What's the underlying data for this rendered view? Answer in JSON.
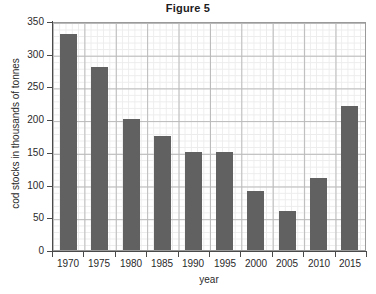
{
  "chart_data": {
    "type": "bar",
    "title": "Figure 5",
    "xlabel": "year",
    "ylabel": "cod stocks in thousands of tonnes",
    "categories": [
      "1970",
      "1975",
      "1980",
      "1985",
      "1990",
      "1995",
      "2000",
      "2005",
      "2010",
      "2015"
    ],
    "values": [
      330,
      280,
      200,
      175,
      150,
      150,
      90,
      60,
      110,
      220
    ],
    "ylim": [
      0,
      350
    ],
    "ytick_values": [
      0,
      50,
      100,
      150,
      200,
      250,
      300,
      350
    ],
    "ytick_labels": [
      "0",
      "50",
      "100",
      "150",
      "200",
      "250",
      "300",
      "350"
    ],
    "xtick_labels": [
      "1970",
      "1975",
      "1980",
      "1985",
      "1990",
      "1995",
      "2000",
      "2005",
      "2010",
      "2015"
    ],
    "grid": "major and minor gridlines on both axes",
    "legend": "none",
    "bar_color": "#616161",
    "grid_major_color": "#b9b9b9",
    "grid_minor_color": "#ececec",
    "axis_color": "#4a4a4a"
  }
}
